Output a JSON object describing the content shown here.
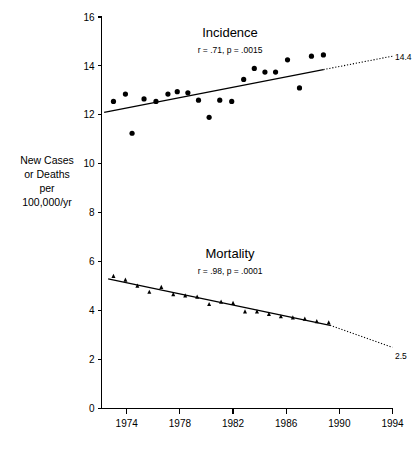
{
  "chart_data": {
    "type": "scatter",
    "title": "",
    "xlabel": "",
    "ylabel": "New Cases or Deaths per 100,000/yr",
    "xlim": [
      1972.1,
      1994
    ],
    "ylim": [
      0,
      16
    ],
    "grid": false,
    "legend": "none",
    "xticks": [
      "1974",
      "1978",
      "1982",
      "1986",
      "1990",
      "1994"
    ],
    "xtick_values": [
      1974,
      1978,
      1982,
      1986,
      1990,
      1994
    ],
    "yticks": [
      "0",
      "2",
      "4",
      "6",
      "8",
      "10",
      "12",
      "14",
      "16"
    ],
    "ytick_values": [
      0,
      2,
      4,
      6,
      8,
      10,
      12,
      14,
      16
    ],
    "series": [
      {
        "name": "Incidence",
        "marker": "circle",
        "annotation": "r = .71, p = .0015",
        "r": 0.71,
        "p": 0.0015,
        "endpoint_label": "14.4",
        "endpoint_value": 14.4,
        "x": [
          1973.0,
          1973.9,
          1974.4,
          1975.3,
          1976.2,
          1977.1,
          1977.8,
          1978.6,
          1979.4,
          1980.2,
          1981.0,
          1981.9,
          1982.8,
          1983.6,
          1984.4,
          1985.2,
          1986.1,
          1987.0,
          1987.9,
          1988.8
        ],
        "y": [
          12.55,
          12.85,
          11.25,
          12.65,
          12.55,
          12.85,
          12.95,
          12.9,
          12.6,
          11.9,
          12.6,
          12.55,
          13.45,
          13.9,
          13.75,
          13.75,
          14.25,
          13.1,
          14.4,
          14.45
        ],
        "fit": {
          "x0": 1972.3,
          "y0": 12.1,
          "x1": 1988.8,
          "y1": 13.85
        },
        "fit_extrapolated": {
          "x0": 1988.8,
          "y0": 13.85,
          "x1": 1994.0,
          "y1": 14.4
        }
      },
      {
        "name": "Mortality",
        "marker": "triangle",
        "annotation": "r = .98, p = .0001",
        "r": 0.98,
        "p": 0.0001,
        "endpoint_label": "2.5",
        "endpoint_value": 2.5,
        "x": [
          1973.0,
          1973.9,
          1974.8,
          1975.7,
          1976.6,
          1977.5,
          1978.4,
          1979.3,
          1980.2,
          1981.1,
          1982.0,
          1982.9,
          1983.8,
          1984.7,
          1985.6,
          1986.5,
          1987.4,
          1988.3,
          1989.2
        ],
        "y": [
          5.4,
          5.25,
          5.0,
          4.75,
          4.95,
          4.65,
          4.6,
          4.55,
          4.25,
          4.35,
          4.3,
          3.95,
          3.95,
          3.85,
          3.75,
          3.7,
          3.65,
          3.55,
          3.5
        ],
        "fit": {
          "x0": 1972.6,
          "y0": 5.3,
          "x1": 1989.3,
          "y1": 3.4
        },
        "fit_extrapolated": {
          "x0": 1989.3,
          "y0": 3.4,
          "x1": 1994.0,
          "y1": 2.5
        }
      }
    ]
  },
  "axis": {
    "y_caption_lines": [
      "New Cases",
      "or Deaths",
      "per",
      "100,000/yr"
    ]
  },
  "labels": {
    "incidence_title": "Incidence",
    "incidence_stats": "r = .71, p = .0015",
    "incidence_endpoint": "14.4",
    "mortality_title": "Mortality",
    "mortality_stats": "r = .98, p = .0001",
    "mortality_endpoint": "2.5"
  },
  "colors": {
    "ink": "#000000",
    "background": "#ffffff"
  }
}
